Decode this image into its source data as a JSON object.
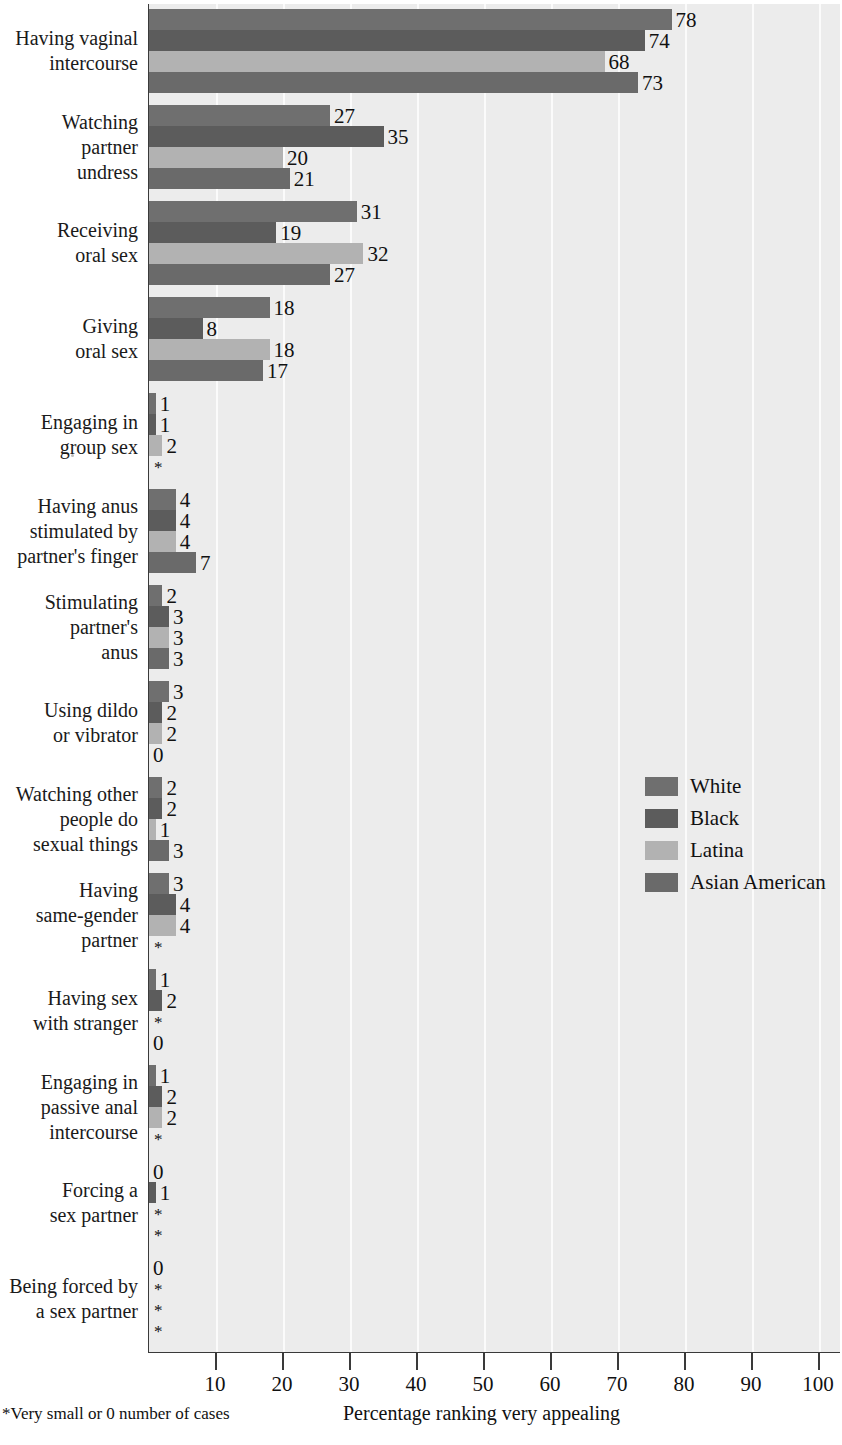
{
  "chart_data": {
    "type": "bar",
    "orientation": "horizontal",
    "title": "",
    "xlabel": "Percentage ranking very appealing",
    "ylabel": "",
    "xlim": [
      0,
      100
    ],
    "xticks": [
      10,
      20,
      30,
      40,
      50,
      60,
      70,
      80,
      90,
      100
    ],
    "grid": true,
    "legend_position": "middle-right",
    "footnote": "*Very small or 0 number of cases",
    "series": [
      {
        "name": "White",
        "key": "w",
        "color": "#6f6f6f",
        "values": [
          78,
          27,
          31,
          18,
          1,
          4,
          2,
          3,
          2,
          3,
          1,
          1,
          0,
          0
        ]
      },
      {
        "name": "Black",
        "key": "b",
        "color": "#5c5c5c",
        "values": [
          74,
          35,
          19,
          8,
          1,
          4,
          3,
          2,
          2,
          4,
          2,
          2,
          1,
          "*"
        ]
      },
      {
        "name": "Latina",
        "key": "l",
        "color": "#b2b2b2",
        "values": [
          68,
          20,
          32,
          18,
          2,
          4,
          3,
          2,
          1,
          4,
          "*",
          2,
          "*",
          "*"
        ]
      },
      {
        "name": "Asian American",
        "key": "a",
        "color": "#6a6a6a",
        "values": [
          73,
          21,
          27,
          17,
          "*",
          7,
          3,
          0,
          3,
          "*",
          0,
          "*",
          "*",
          "*"
        ]
      }
    ],
    "categories": [
      "Having vaginal intercourse",
      "Watching partner undress",
      "Receiving oral sex",
      "Giving oral sex",
      "Engaging in group sex",
      "Having anus stimulated by partner's finger",
      "Stimulating partner's anus",
      "Using dildo or vibrator",
      "Watching other people do sexual things",
      "Having same-gender partner",
      "Having sex with stranger",
      "Engaging in passive anal intercourse",
      "Forcing a sex partner",
      "Being forced by a sex partner"
    ],
    "category_label_lines": [
      [
        "Having vaginal",
        "intercourse"
      ],
      [
        "Watching",
        "partner",
        "undress"
      ],
      [
        "Receiving",
        "oral sex"
      ],
      [
        "Giving",
        "oral sex"
      ],
      [
        "Engaging in",
        "group sex"
      ],
      [
        "Having anus",
        "stimulated by",
        "partner's finger"
      ],
      [
        "Stimulating",
        "partner's",
        "anus"
      ],
      [
        "Using dildo",
        "or vibrator"
      ],
      [
        "Watching other",
        "people do",
        "sexual things"
      ],
      [
        "Having",
        "same-gender",
        "partner"
      ],
      [
        "Having sex",
        "with stranger"
      ],
      [
        "Engaging in",
        "passive anal",
        "intercourse"
      ],
      [
        "Forcing a",
        "sex partner"
      ],
      [
        "Being forced by",
        "a sex partner"
      ]
    ]
  },
  "legend": {
    "items": [
      {
        "label": "White",
        "color": "#6f6f6f"
      },
      {
        "label": "Black",
        "color": "#5c5c5c"
      },
      {
        "label": "Latina",
        "color": "#b2b2b2"
      },
      {
        "label": "Asian American",
        "color": "#6a6a6a"
      }
    ]
  },
  "axis": {
    "ticks": [
      "10",
      "20",
      "30",
      "40",
      "50",
      "60",
      "70",
      "80",
      "90",
      "100"
    ],
    "title": "Percentage ranking very appealing"
  },
  "footnote": {
    "text": "*Very small or 0 number of cases"
  }
}
